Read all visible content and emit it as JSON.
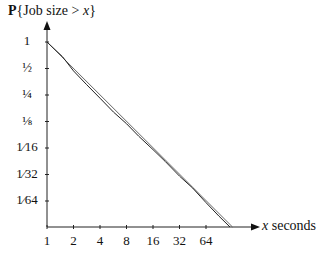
{
  "chart_data": {
    "type": "line",
    "title": "P{Job size > x}",
    "title_parts": {
      "bold": "P",
      "rest_open": "{Job size > ",
      "var": "x",
      "rest_close": "}"
    },
    "xlabel": "x seconds",
    "xlabel_parts": {
      "var": "x",
      "unit": "seconds"
    },
    "ylabel": "P{Job size > x}",
    "x_scale": "log2",
    "y_scale": "log2",
    "x_ticks": [
      "1",
      "2",
      "4",
      "8",
      "16",
      "32",
      "64"
    ],
    "x_tick_values": [
      1,
      2,
      4,
      8,
      16,
      32,
      64
    ],
    "y_ticks": [
      "1",
      "½",
      "¼",
      "⅛",
      "1⁄16",
      "1⁄32",
      "1⁄64"
    ],
    "y_tick_values": [
      1,
      0.5,
      0.25,
      0.125,
      0.0625,
      0.03125,
      0.015625
    ],
    "xlim": [
      1,
      128
    ],
    "ylim": [
      0.0078125,
      1
    ],
    "grid": false,
    "legend": null,
    "series": [
      {
        "name": "Pareto fit (straight line)",
        "x": [
          1,
          128
        ],
        "y": [
          1,
          0.0078125
        ]
      },
      {
        "name": "Measured distribution",
        "x": [
          1,
          1.5,
          2,
          2.8,
          4,
          5.7,
          8,
          11,
          16,
          22,
          32,
          45,
          64,
          90,
          120
        ],
        "y": [
          1,
          0.68,
          0.47,
          0.33,
          0.23,
          0.16,
          0.118,
          0.085,
          0.06,
          0.044,
          0.03,
          0.022,
          0.015,
          0.0105,
          0.0078
        ]
      }
    ]
  },
  "labels": {
    "title_bold": "P",
    "title_open": "{Job size > ",
    "title_var": "x",
    "title_close": "}",
    "xlabel_var": "x",
    "xlabel_unit": " seconds",
    "y": [
      "1",
      "½",
      "¼",
      "⅛",
      "1⁄16",
      "1⁄32",
      "1⁄64"
    ],
    "x": [
      "1",
      "2",
      "4",
      "8",
      "16",
      "32",
      "64"
    ]
  }
}
